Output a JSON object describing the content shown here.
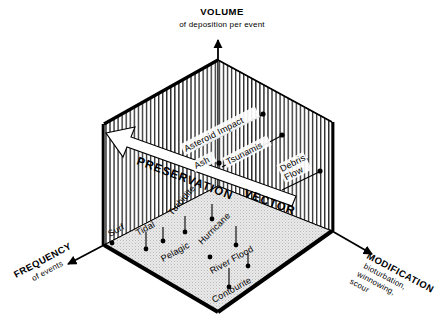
{
  "figure": {
    "type": "3d-axis-conceptual-diagram"
  },
  "axes": {
    "vertical": {
      "name": "volume-axis",
      "title": "VOLUME",
      "subtitle": "of deposition per event",
      "direction": "up"
    },
    "left": {
      "name": "frequency-axis",
      "title": "FREQUENCY",
      "subtitle": "of events",
      "direction": "down-left"
    },
    "right": {
      "name": "modification-axis",
      "title": "MODIFICATION",
      "subtitle_lines": [
        "bioturbation,",
        "winnowing,",
        "scour"
      ],
      "direction": "down-right"
    }
  },
  "vector": {
    "name": "preservation-vector",
    "word1": "PRESERVATION",
    "word2": "VECTOR",
    "direction": "up-left"
  },
  "points": [
    {
      "label": "Asteroid Impact",
      "surface": "back-right-wall",
      "lines": [
        "Asteroid Impact"
      ]
    },
    {
      "label": "Tsunamis",
      "surface": "back-right-wall",
      "lines": [
        "Tsunamis"
      ]
    },
    {
      "label": "Ash",
      "surface": "back-right-wall",
      "lines": [
        "Ash"
      ]
    },
    {
      "label": "Debris Flow",
      "surface": "back-right-wall",
      "lines": [
        "Debris,",
        "Flow"
      ]
    },
    {
      "label": "Surf",
      "surface": "floor",
      "lines": [
        "Surf"
      ]
    },
    {
      "label": "Tidal",
      "surface": "floor",
      "lines": [
        "Tidal"
      ]
    },
    {
      "label": "Turbidite",
      "surface": "floor",
      "lines": [
        "Turbidite"
      ]
    },
    {
      "label": "Pelagic",
      "surface": "floor",
      "lines": [
        "Pelagic"
      ]
    },
    {
      "label": "Hurricane",
      "surface": "floor",
      "lines": [
        "Hurricane"
      ]
    },
    {
      "label": "River Flood",
      "surface": "floor",
      "lines": [
        "River Flood"
      ]
    },
    {
      "label": "Contourite",
      "surface": "floor",
      "lines": [
        "Contourite"
      ]
    }
  ],
  "colors": {
    "ink": "#000000",
    "floor_fill": "#e6e6e6",
    "wall_fill": "#ffffff",
    "hatch": "#1a1a1a",
    "vector_fill": "#ffffff"
  }
}
